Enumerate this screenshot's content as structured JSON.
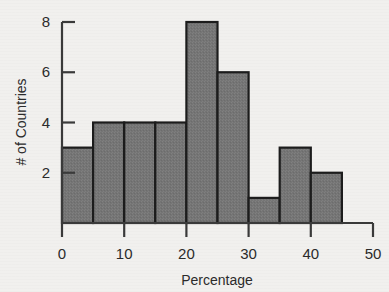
{
  "chart_data": {
    "type": "bar",
    "title": "",
    "subtitle": "",
    "xlabel": "Percentage",
    "ylabel": "# of Countries",
    "bin_width": 5,
    "bin_edges": [
      0,
      5,
      10,
      15,
      20,
      25,
      30,
      35,
      40,
      45
    ],
    "categories": [
      "0-5",
      "5-10",
      "10-15",
      "15-20",
      "20-25",
      "25-30",
      "30-35",
      "35-40",
      "40-45"
    ],
    "values": [
      3,
      4,
      4,
      4,
      8,
      6,
      1,
      3,
      2
    ],
    "xlim": [
      0,
      50
    ],
    "ylim": [
      0,
      8
    ],
    "x_ticks": [
      0,
      10,
      20,
      30,
      40,
      50
    ],
    "x_tick_labels": [
      "0",
      "10",
      "20",
      "30",
      "40",
      "50"
    ],
    "y_ticks": [
      2,
      4,
      6,
      8
    ],
    "y_tick_labels": [
      "2",
      "4",
      "6",
      "8"
    ],
    "grid": false,
    "legend": null,
    "legend_position": "none",
    "bar_fill_color": "#757575",
    "bar_edge_color": "#1c1c1c",
    "axis_color": "#3a3a3a",
    "background_color": "#f1f0ee",
    "text_color": "#2b2b2b"
  },
  "labels": {
    "x_axis_title": "Percentage",
    "y_axis_title": "# of Countries"
  }
}
